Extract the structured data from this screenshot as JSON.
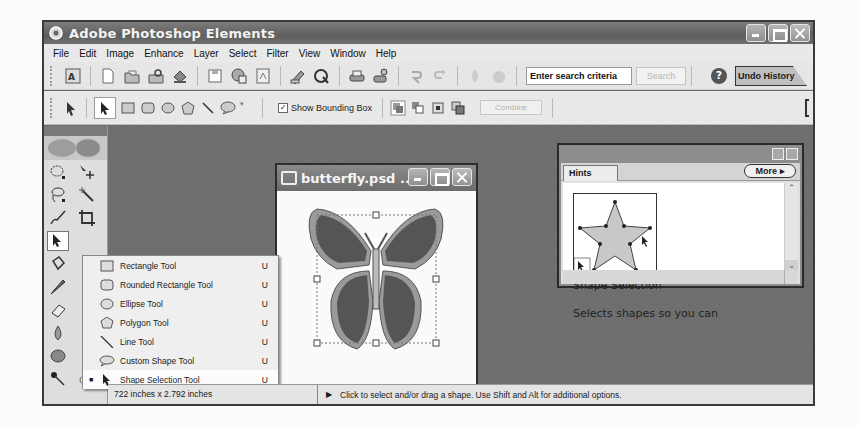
{
  "window": {
    "title": "Adobe Photoshop Elements",
    "controls": [
      "minimize",
      "maximize",
      "close"
    ]
  },
  "menubar": {
    "items": [
      "File",
      "Edit",
      "Image",
      "Enhance",
      "Layer",
      "Select",
      "Filter",
      "View",
      "Window",
      "Help"
    ]
  },
  "toolbar": {
    "icons": [
      "adobe-logo-icon",
      "new-document-icon",
      "open-folder-icon",
      "browse-icon",
      "import-icon",
      "save-icon",
      "save-for-web-icon",
      "pdf-icon",
      "print-preview-icon",
      "online-services-icon",
      "print-icon",
      "print-online-icon",
      "undo-icon",
      "redo-icon",
      "step-backward-icon",
      "step-forward-icon"
    ],
    "search_placeholder": "Enter search criteria",
    "search_value": "Enter search criteria",
    "search_button": "Search",
    "help_glyph": "?",
    "undo_history_tab": "Undo History"
  },
  "options_bar": {
    "tools": [
      "shape-selection-tool",
      "rectangle-tool",
      "rounded-rectangle-tool",
      "ellipse-tool",
      "polygon-tool",
      "line-tool",
      "custom-shape-tool"
    ],
    "show_bounding_box_label": "Show Bounding Box",
    "show_bounding_box_checked": true,
    "combine_label": "Combine"
  },
  "flyout_menu": {
    "items": [
      {
        "label": "Rectangle Tool",
        "key": "U",
        "selected": false
      },
      {
        "label": "Rounded Rectangle Tool",
        "key": "U",
        "selected": false
      },
      {
        "label": "Ellipse Tool",
        "key": "U",
        "selected": false
      },
      {
        "label": "Polygon Tool",
        "key": "U",
        "selected": false
      },
      {
        "label": "Line Tool",
        "key": "U",
        "selected": false
      },
      {
        "label": "Custom Shape Tool",
        "key": "U",
        "selected": false
      },
      {
        "label": "Shape Selection Tool",
        "key": "U",
        "selected": true
      }
    ]
  },
  "document": {
    "title": "butterfly.psd ...",
    "size_text": "722 inches x 2.792 inches"
  },
  "hints": {
    "tab_label": "Hints",
    "more_label": "More",
    "heading": "Shape Selection",
    "text": "Selects shapes so you can"
  },
  "status": {
    "message": "Click to select and/or drag a shape.  Use Shift and Alt for additional options."
  }
}
